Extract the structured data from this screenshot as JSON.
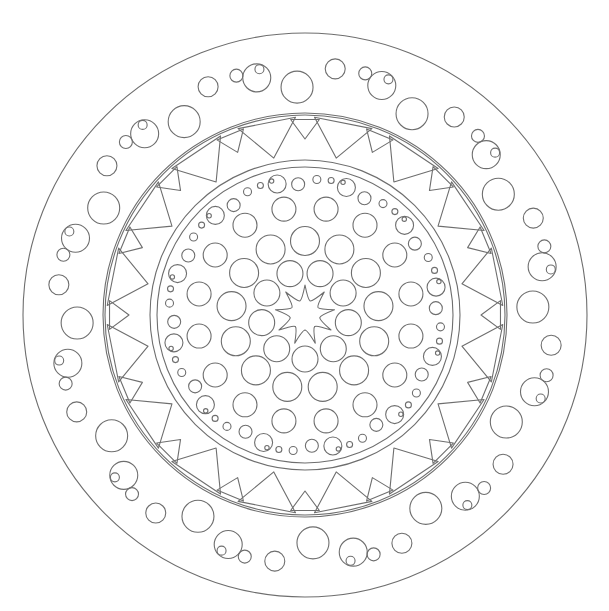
{
  "document": {
    "title": "Mandala Coloring Page",
    "type": "line-art-illustration",
    "subject": "circular mandala",
    "canvas": {
      "width": 609,
      "height": 611,
      "background": "#ffffff"
    },
    "line_color": "#6e6e6e",
    "line_width": 1.1
  },
  "geometry": {
    "center_x": 305,
    "center_y": 315,
    "outer_radius": 282
  },
  "rings": [
    {
      "name": "outer-border-ring",
      "type": "band",
      "r_outer": 282,
      "r_inner": 202,
      "description": "outermost plain annular border band"
    },
    {
      "name": "outer-circle-ring",
      "type": "circle-cluster-band",
      "r_outer": 282,
      "r_inner": 202,
      "cluster_count": 12,
      "cluster_pattern": [
        {
          "r_pos": 242,
          "radius": 14,
          "angle_offset": -11.5
        },
        {
          "r_pos": 228,
          "radius": 16,
          "angle_offset": -2.0
        },
        {
          "r_pos": 248,
          "radius": 10,
          "angle_offset": 7.0
        },
        {
          "r_pos": 249,
          "radius": 6.5,
          "angle_offset": 14.0
        },
        {
          "r_pos": 250,
          "radius": 4.5,
          "angle_offset": 19.5
        }
      ],
      "description": "repeating groups of 5 circles descending in size"
    },
    {
      "name": "middle-band-ring",
      "type": "band",
      "r_outer": 200,
      "r_inner": 155,
      "description": "annular band hosting triangle motifs"
    },
    {
      "name": "triangle-ring",
      "type": "triangle-band",
      "r_outer": 200,
      "r_inner": 155,
      "large_triangle_count": 16,
      "small_triangle_count": 16,
      "large_triangle": {
        "base_r": 198,
        "apex_r": 160,
        "half_width_deg": 8.5
      },
      "small_triangle": {
        "base_r": 196,
        "apex_r": 176,
        "half_width_deg": 4.2
      },
      "description": "alternating large and small triangles pointing toward center"
    },
    {
      "name": "inner-disc-boundary",
      "type": "circle",
      "r": 148,
      "description": "boundary circle of the inner disc"
    },
    {
      "name": "inner-dot-ring-1",
      "type": "circle-cluster-band",
      "r_pos": 133,
      "cluster_count": 12,
      "cluster_pattern": [
        {
          "r_pos": 134,
          "radius": 9.0,
          "angle_offset": -12.0
        },
        {
          "r_pos": 131,
          "radius": 6.5,
          "angle_offset": -3.0
        },
        {
          "r_pos": 136,
          "radius": 4.0,
          "angle_offset": 5.0
        },
        {
          "r_pos": 137,
          "radius": 3.0,
          "angle_offset": 11.0
        },
        {
          "r_pos": 138,
          "radius": 2.2,
          "angle_offset": 16.0
        }
      ],
      "description": "outer ring of small graduated circles inside disc"
    },
    {
      "name": "inner-circle-ring-2",
      "type": "circle-ring",
      "r_pos": 108,
      "count": 16,
      "radius": 12.0,
      "angle_offset": 11.25,
      "description": "ring of medium circles"
    },
    {
      "name": "inner-circle-ring-3",
      "type": "circle-ring",
      "r_pos": 74,
      "count": 13,
      "radius": 14.5,
      "angle_offset": 0,
      "description": "ring of large circles"
    },
    {
      "name": "inner-circle-ring-4",
      "type": "circle-ring",
      "r_pos": 44,
      "count": 9,
      "radius": 13.0,
      "angle_offset": 20,
      "description": "ring of circles closest to the central star"
    },
    {
      "name": "center-star",
      "type": "star",
      "points": 9,
      "r_outer": 30,
      "r_inner": 15,
      "description": "nine-pointed flower star at the mandala center"
    }
  ],
  "labels": {
    "page_title": "Mandala Coloring Page",
    "alt_text": "Black and white circular mandala line drawing with concentric rings of circles, triangles, and a nine-pointed star at the center."
  }
}
